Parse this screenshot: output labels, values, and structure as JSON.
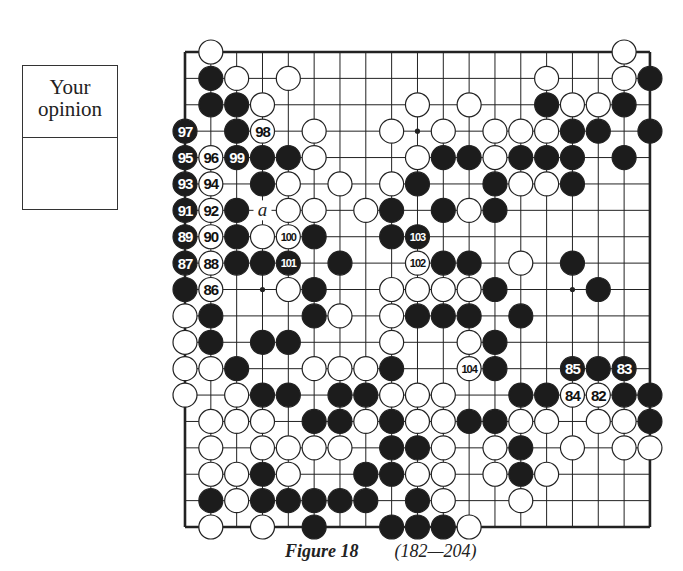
{
  "opinion_box": {
    "title_line1": "Your",
    "title_line2": "opinion",
    "answer": ""
  },
  "figure": {
    "label": "Figure 18",
    "range": "(182—204)"
  },
  "board": {
    "size": 19,
    "origin_x": 185,
    "origin_y": 52,
    "spacing_x": 25.83,
    "spacing_y": 26.39,
    "stone_radius": 12,
    "star_points": [
      [
        3,
        3
      ],
      [
        3,
        9
      ],
      [
        3,
        15
      ],
      [
        9,
        3
      ],
      [
        9,
        9
      ],
      [
        9,
        15
      ],
      [
        15,
        3
      ],
      [
        15,
        9
      ],
      [
        15,
        15
      ]
    ],
    "marks": [
      {
        "row": 6,
        "col": 3,
        "text": "a"
      }
    ],
    "stones": [
      {
        "r": 0,
        "c": 1,
        "color": "W"
      },
      {
        "r": 0,
        "c": 17,
        "color": "W"
      },
      {
        "r": 1,
        "c": 1,
        "color": "B"
      },
      {
        "r": 1,
        "c": 2,
        "color": "W"
      },
      {
        "r": 1,
        "c": 4,
        "color": "W"
      },
      {
        "r": 1,
        "c": 14,
        "color": "W"
      },
      {
        "r": 1,
        "c": 17,
        "color": "W"
      },
      {
        "r": 1,
        "c": 18,
        "color": "B"
      },
      {
        "r": 2,
        "c": 1,
        "color": "B"
      },
      {
        "r": 2,
        "c": 2,
        "color": "B"
      },
      {
        "r": 2,
        "c": 3,
        "color": "W"
      },
      {
        "r": 2,
        "c": 9,
        "color": "W"
      },
      {
        "r": 2,
        "c": 11,
        "color": "W"
      },
      {
        "r": 2,
        "c": 14,
        "color": "B"
      },
      {
        "r": 2,
        "c": 15,
        "color": "W"
      },
      {
        "r": 2,
        "c": 16,
        "color": "W"
      },
      {
        "r": 2,
        "c": 17,
        "color": "B"
      },
      {
        "r": 3,
        "c": 0,
        "color": "B",
        "n": "97"
      },
      {
        "r": 3,
        "c": 2,
        "color": "B"
      },
      {
        "r": 3,
        "c": 3,
        "color": "W",
        "n": "98"
      },
      {
        "r": 3,
        "c": 5,
        "color": "W"
      },
      {
        "r": 3,
        "c": 8,
        "color": "W"
      },
      {
        "r": 3,
        "c": 10,
        "color": "W"
      },
      {
        "r": 3,
        "c": 12,
        "color": "W"
      },
      {
        "r": 3,
        "c": 13,
        "color": "W"
      },
      {
        "r": 3,
        "c": 14,
        "color": "W"
      },
      {
        "r": 3,
        "c": 15,
        "color": "B"
      },
      {
        "r": 3,
        "c": 16,
        "color": "B"
      },
      {
        "r": 3,
        "c": 18,
        "color": "B"
      },
      {
        "r": 4,
        "c": 0,
        "color": "B",
        "n": "95"
      },
      {
        "r": 4,
        "c": 1,
        "color": "W",
        "n": "96"
      },
      {
        "r": 4,
        "c": 2,
        "color": "B",
        "n": "99"
      },
      {
        "r": 4,
        "c": 3,
        "color": "B"
      },
      {
        "r": 4,
        "c": 4,
        "color": "B"
      },
      {
        "r": 4,
        "c": 5,
        "color": "W"
      },
      {
        "r": 4,
        "c": 9,
        "color": "W"
      },
      {
        "r": 4,
        "c": 10,
        "color": "B"
      },
      {
        "r": 4,
        "c": 11,
        "color": "B"
      },
      {
        "r": 4,
        "c": 12,
        "color": "W"
      },
      {
        "r": 4,
        "c": 13,
        "color": "B"
      },
      {
        "r": 4,
        "c": 14,
        "color": "B"
      },
      {
        "r": 4,
        "c": 15,
        "color": "B"
      },
      {
        "r": 4,
        "c": 17,
        "color": "B"
      },
      {
        "r": 5,
        "c": 0,
        "color": "B",
        "n": "93"
      },
      {
        "r": 5,
        "c": 1,
        "color": "W",
        "n": "94"
      },
      {
        "r": 5,
        "c": 3,
        "color": "B"
      },
      {
        "r": 5,
        "c": 4,
        "color": "W"
      },
      {
        "r": 5,
        "c": 6,
        "color": "W"
      },
      {
        "r": 5,
        "c": 8,
        "color": "W"
      },
      {
        "r": 5,
        "c": 9,
        "color": "B"
      },
      {
        "r": 5,
        "c": 12,
        "color": "B"
      },
      {
        "r": 5,
        "c": 13,
        "color": "W"
      },
      {
        "r": 5,
        "c": 14,
        "color": "W"
      },
      {
        "r": 5,
        "c": 15,
        "color": "B"
      },
      {
        "r": 6,
        "c": 0,
        "color": "B",
        "n": "91"
      },
      {
        "r": 6,
        "c": 1,
        "color": "W",
        "n": "92"
      },
      {
        "r": 6,
        "c": 2,
        "color": "B"
      },
      {
        "r": 6,
        "c": 4,
        "color": "W"
      },
      {
        "r": 6,
        "c": 5,
        "color": "W"
      },
      {
        "r": 6,
        "c": 7,
        "color": "W"
      },
      {
        "r": 6,
        "c": 8,
        "color": "B"
      },
      {
        "r": 6,
        "c": 10,
        "color": "B"
      },
      {
        "r": 6,
        "c": 11,
        "color": "W"
      },
      {
        "r": 6,
        "c": 12,
        "color": "B"
      },
      {
        "r": 7,
        "c": 0,
        "color": "B",
        "n": "89"
      },
      {
        "r": 7,
        "c": 1,
        "color": "W",
        "n": "90"
      },
      {
        "r": 7,
        "c": 2,
        "color": "B"
      },
      {
        "r": 7,
        "c": 3,
        "color": "W"
      },
      {
        "r": 7,
        "c": 4,
        "color": "W",
        "n": "100"
      },
      {
        "r": 7,
        "c": 5,
        "color": "B"
      },
      {
        "r": 7,
        "c": 8,
        "color": "B"
      },
      {
        "r": 7,
        "c": 9,
        "color": "B",
        "n": "103"
      },
      {
        "r": 8,
        "c": 0,
        "color": "B",
        "n": "87"
      },
      {
        "r": 8,
        "c": 1,
        "color": "W",
        "n": "88"
      },
      {
        "r": 8,
        "c": 2,
        "color": "B"
      },
      {
        "r": 8,
        "c": 3,
        "color": "B"
      },
      {
        "r": 8,
        "c": 4,
        "color": "B",
        "n": "101"
      },
      {
        "r": 8,
        "c": 6,
        "color": "B"
      },
      {
        "r": 8,
        "c": 9,
        "color": "W",
        "n": "102"
      },
      {
        "r": 8,
        "c": 10,
        "color": "B"
      },
      {
        "r": 8,
        "c": 11,
        "color": "B"
      },
      {
        "r": 8,
        "c": 13,
        "color": "W"
      },
      {
        "r": 8,
        "c": 15,
        "color": "B"
      },
      {
        "r": 9,
        "c": 0,
        "color": "B"
      },
      {
        "r": 9,
        "c": 1,
        "color": "W",
        "n": "86"
      },
      {
        "r": 9,
        "c": 4,
        "color": "W"
      },
      {
        "r": 9,
        "c": 5,
        "color": "B"
      },
      {
        "r": 9,
        "c": 8,
        "color": "W"
      },
      {
        "r": 9,
        "c": 9,
        "color": "W"
      },
      {
        "r": 9,
        "c": 10,
        "color": "W"
      },
      {
        "r": 9,
        "c": 11,
        "color": "W"
      },
      {
        "r": 9,
        "c": 12,
        "color": "B"
      },
      {
        "r": 9,
        "c": 16,
        "color": "B"
      },
      {
        "r": 10,
        "c": 0,
        "color": "W"
      },
      {
        "r": 10,
        "c": 1,
        "color": "B"
      },
      {
        "r": 10,
        "c": 5,
        "color": "B"
      },
      {
        "r": 10,
        "c": 6,
        "color": "W"
      },
      {
        "r": 10,
        "c": 8,
        "color": "W"
      },
      {
        "r": 10,
        "c": 9,
        "color": "B"
      },
      {
        "r": 10,
        "c": 10,
        "color": "B"
      },
      {
        "r": 10,
        "c": 11,
        "color": "B"
      },
      {
        "r": 10,
        "c": 13,
        "color": "B"
      },
      {
        "r": 11,
        "c": 0,
        "color": "W"
      },
      {
        "r": 11,
        "c": 1,
        "color": "B"
      },
      {
        "r": 11,
        "c": 3,
        "color": "B"
      },
      {
        "r": 11,
        "c": 4,
        "color": "B"
      },
      {
        "r": 11,
        "c": 8,
        "color": "W"
      },
      {
        "r": 11,
        "c": 11,
        "color": "W"
      },
      {
        "r": 11,
        "c": 12,
        "color": "B"
      },
      {
        "r": 12,
        "c": 0,
        "color": "W"
      },
      {
        "r": 12,
        "c": 1,
        "color": "W"
      },
      {
        "r": 12,
        "c": 2,
        "color": "B"
      },
      {
        "r": 12,
        "c": 5,
        "color": "W"
      },
      {
        "r": 12,
        "c": 6,
        "color": "W"
      },
      {
        "r": 12,
        "c": 7,
        "color": "W"
      },
      {
        "r": 12,
        "c": 8,
        "color": "B"
      },
      {
        "r": 12,
        "c": 11,
        "color": "W",
        "n": "104"
      },
      {
        "r": 12,
        "c": 12,
        "color": "B"
      },
      {
        "r": 12,
        "c": 15,
        "color": "B",
        "n": "85"
      },
      {
        "r": 12,
        "c": 16,
        "color": "B"
      },
      {
        "r": 12,
        "c": 17,
        "color": "B",
        "n": "83"
      },
      {
        "r": 13,
        "c": 0,
        "color": "W"
      },
      {
        "r": 13,
        "c": 2,
        "color": "W"
      },
      {
        "r": 13,
        "c": 3,
        "color": "B"
      },
      {
        "r": 13,
        "c": 4,
        "color": "B"
      },
      {
        "r": 13,
        "c": 6,
        "color": "B"
      },
      {
        "r": 13,
        "c": 7,
        "color": "B"
      },
      {
        "r": 13,
        "c": 8,
        "color": "W"
      },
      {
        "r": 13,
        "c": 9,
        "color": "W"
      },
      {
        "r": 13,
        "c": 10,
        "color": "W"
      },
      {
        "r": 13,
        "c": 13,
        "color": "B"
      },
      {
        "r": 13,
        "c": 14,
        "color": "B"
      },
      {
        "r": 13,
        "c": 15,
        "color": "W",
        "n": "84"
      },
      {
        "r": 13,
        "c": 16,
        "color": "W",
        "n": "82"
      },
      {
        "r": 13,
        "c": 17,
        "color": "B"
      },
      {
        "r": 13,
        "c": 18,
        "color": "B"
      },
      {
        "r": 14,
        "c": 1,
        "color": "W"
      },
      {
        "r": 14,
        "c": 2,
        "color": "W"
      },
      {
        "r": 14,
        "c": 3,
        "color": "W"
      },
      {
        "r": 14,
        "c": 5,
        "color": "B"
      },
      {
        "r": 14,
        "c": 6,
        "color": "B"
      },
      {
        "r": 14,
        "c": 7,
        "color": "W"
      },
      {
        "r": 14,
        "c": 8,
        "color": "B"
      },
      {
        "r": 14,
        "c": 9,
        "color": "W"
      },
      {
        "r": 14,
        "c": 10,
        "color": "W"
      },
      {
        "r": 14,
        "c": 11,
        "color": "B"
      },
      {
        "r": 14,
        "c": 12,
        "color": "B"
      },
      {
        "r": 14,
        "c": 13,
        "color": "W"
      },
      {
        "r": 14,
        "c": 14,
        "color": "W"
      },
      {
        "r": 14,
        "c": 16,
        "color": "W"
      },
      {
        "r": 14,
        "c": 17,
        "color": "W"
      },
      {
        "r": 14,
        "c": 18,
        "color": "B"
      },
      {
        "r": 15,
        "c": 1,
        "color": "W"
      },
      {
        "r": 15,
        "c": 3,
        "color": "W"
      },
      {
        "r": 15,
        "c": 4,
        "color": "W"
      },
      {
        "r": 15,
        "c": 5,
        "color": "W"
      },
      {
        "r": 15,
        "c": 6,
        "color": "W"
      },
      {
        "r": 15,
        "c": 8,
        "color": "B"
      },
      {
        "r": 15,
        "c": 9,
        "color": "B"
      },
      {
        "r": 15,
        "c": 10,
        "color": "W"
      },
      {
        "r": 15,
        "c": 12,
        "color": "W"
      },
      {
        "r": 15,
        "c": 13,
        "color": "B"
      },
      {
        "r": 15,
        "c": 15,
        "color": "W"
      },
      {
        "r": 15,
        "c": 17,
        "color": "W"
      },
      {
        "r": 15,
        "c": 18,
        "color": "W"
      },
      {
        "r": 16,
        "c": 1,
        "color": "W"
      },
      {
        "r": 16,
        "c": 2,
        "color": "W"
      },
      {
        "r": 16,
        "c": 3,
        "color": "B"
      },
      {
        "r": 16,
        "c": 4,
        "color": "W"
      },
      {
        "r": 16,
        "c": 7,
        "color": "B"
      },
      {
        "r": 16,
        "c": 8,
        "color": "B"
      },
      {
        "r": 16,
        "c": 9,
        "color": "W"
      },
      {
        "r": 16,
        "c": 10,
        "color": "W"
      },
      {
        "r": 16,
        "c": 12,
        "color": "W"
      },
      {
        "r": 16,
        "c": 13,
        "color": "B"
      },
      {
        "r": 16,
        "c": 14,
        "color": "W"
      },
      {
        "r": 17,
        "c": 1,
        "color": "B"
      },
      {
        "r": 17,
        "c": 2,
        "color": "W"
      },
      {
        "r": 17,
        "c": 3,
        "color": "B"
      },
      {
        "r": 17,
        "c": 4,
        "color": "B"
      },
      {
        "r": 17,
        "c": 5,
        "color": "B"
      },
      {
        "r": 17,
        "c": 6,
        "color": "B"
      },
      {
        "r": 17,
        "c": 7,
        "color": "B"
      },
      {
        "r": 17,
        "c": 9,
        "color": "B"
      },
      {
        "r": 17,
        "c": 10,
        "color": "W"
      },
      {
        "r": 17,
        "c": 13,
        "color": "W"
      },
      {
        "r": 18,
        "c": 1,
        "color": "W"
      },
      {
        "r": 18,
        "c": 3,
        "color": "W"
      },
      {
        "r": 18,
        "c": 5,
        "color": "B"
      },
      {
        "r": 18,
        "c": 8,
        "color": "B"
      },
      {
        "r": 18,
        "c": 9,
        "color": "B"
      },
      {
        "r": 18,
        "c": 10,
        "color": "B"
      },
      {
        "r": 18,
        "c": 11,
        "color": "W"
      }
    ]
  },
  "colors": {
    "black_stone": "#1c1c1c",
    "white_stone": "#ffffff",
    "line": "#222222"
  }
}
